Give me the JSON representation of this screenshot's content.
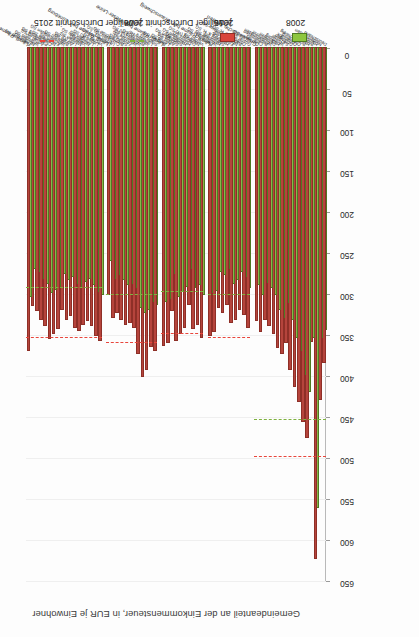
{
  "figure": {
    "axis_title": "Gemeindeanteil an der Einkommensteuer, in EUR je Einwohner",
    "orientation": "rotated-90"
  },
  "legend": {
    "items": [
      {
        "key": "avg2015",
        "label": "jeweiliger Durchschnitt 2015",
        "marker": "dashed-line",
        "color": "#e8463c"
      },
      {
        "key": "avg2008",
        "label": "jeweiliger Durchschnitt 2008",
        "marker": "dashed-line",
        "color": "#7fb23f"
      },
      {
        "key": "y2015",
        "label": "2015",
        "marker": "bar",
        "color": "#d9453c"
      },
      {
        "key": "y2008",
        "label": "2008",
        "marker": "bar",
        "color": "#8ec63f"
      }
    ]
  },
  "chart_data": {
    "type": "bar",
    "orientation": "horizontal",
    "title": "",
    "xlabel": "Gemeindeanteil an der Einkommensteuer, in EUR je Einwohner",
    "ylabel": "",
    "xlim": [
      0,
      650
    ],
    "xticks": [
      0,
      50,
      100,
      150,
      200,
      250,
      300,
      350,
      400,
      450,
      500,
      550,
      600,
      650
    ],
    "grid": true,
    "legend_position": "right",
    "series": [
      {
        "name": "2008",
        "color": "#8ec63f"
      },
      {
        "name": "2015",
        "color": "#d9453c"
      }
    ],
    "groups": [
      {
        "name": "Großstädtische Zentren",
        "avg2008": 452,
        "avg2015": 497,
        "categories": [
          {
            "label": "Deutschland",
            "y2008": 343,
            "y2015": 383
          },
          {
            "label": "Niedersachsen",
            "y2008": 352,
            "y2015": 428
          },
          {
            "label": "Hamburg",
            "y2008": 560,
            "y2015": 622
          },
          {
            "label": "Bremen",
            "y2008": 352,
            "y2015": 357
          },
          {
            "label": "Hannover",
            "y2008": 418,
            "y2015": 475
          },
          {
            "label": "Braunschweig",
            "y2008": 398,
            "y2015": 455
          },
          {
            "label": "Oldenburg",
            "y2008": 368,
            "y2015": 430
          },
          {
            "label": "Osnabrück",
            "y2008": 352,
            "y2015": 412
          },
          {
            "label": "Göttingen",
            "y2008": 330,
            "y2015": 392
          },
          {
            "label": "Salzgitter",
            "y2008": 310,
            "y2015": 358
          },
          {
            "label": "Wolfsburg",
            "y2008": 328,
            "y2015": 372
          },
          {
            "label": "Hildesheim",
            "y2008": 318,
            "y2015": 365
          },
          {
            "label": "Delmenhorst",
            "y2008": 300,
            "y2015": 348
          },
          {
            "label": "Wilhelmshaven",
            "y2008": 292,
            "y2015": 338
          },
          {
            "label": "Bremerhaven",
            "y2008": 285,
            "y2015": 330
          },
          {
            "label": "Celle SG",
            "y2008": 300,
            "y2015": 345
          },
          {
            "label": "Cuxhaven SG",
            "y2008": 288,
            "y2015": 332
          }
        ]
      },
      {
        "name": "Ländl. Räume bez. Braunschweig",
        "avg2008": 300,
        "avg2015": 352,
        "categories": [
          {
            "label": "Goslar SG",
            "y2008": 292,
            "y2015": 340
          },
          {
            "label": "Osterode a. H. SG",
            "y2008": 278,
            "y2015": 325
          },
          {
            "label": "Bad Gandersheim SG",
            "y2008": 272,
            "y2015": 318
          },
          {
            "label": "Northeim SG",
            "y2008": 282,
            "y2015": 330
          },
          {
            "label": "Einbeck SG",
            "y2008": 286,
            "y2015": 334
          },
          {
            "label": "Herzberg a. H. SG",
            "y2008": 268,
            "y2015": 312
          },
          {
            "label": "Seesen SG",
            "y2008": 276,
            "y2015": 322
          },
          {
            "label": "Helmstedt SG",
            "y2008": 272,
            "y2015": 316
          },
          {
            "label": "Wolfenbüttel SG",
            "y2008": 295,
            "y2015": 345
          },
          {
            "label": "Peine SG",
            "y2008": 298,
            "y2015": 350
          }
        ]
      },
      {
        "name": "Ländl. Räume bez. Weser-Leine",
        "avg2008": 296,
        "avg2015": 348,
        "categories": [
          {
            "label": "Verden SG",
            "y2008": 300,
            "y2015": 352
          },
          {
            "label": "Nienburg (W) SG",
            "y2008": 288,
            "y2015": 336
          },
          {
            "label": "Diepholz SG",
            "y2008": 292,
            "y2015": 342
          },
          {
            "label": "Holzminden SG",
            "y2008": 268,
            "y2015": 312
          },
          {
            "label": "Hameln SG",
            "y2008": 290,
            "y2015": 340
          },
          {
            "label": "Stadthagen SG",
            "y2008": 296,
            "y2015": 348
          },
          {
            "label": "Springe SG",
            "y2008": 302,
            "y2015": 356
          },
          {
            "label": "Alfeld SG",
            "y2008": 274,
            "y2015": 320
          },
          {
            "label": "Lehrte SG",
            "y2008": 305,
            "y2015": 358
          },
          {
            "label": "Burgdorf SG",
            "y2008": 308,
            "y2015": 362
          }
        ]
      },
      {
        "name": "Ländl. Räume bez. Lüneburg",
        "avg2008": 300,
        "avg2015": 358,
        "categories": [
          {
            "label": "Stade SG",
            "y2008": 312,
            "y2015": 368
          },
          {
            "label": "Lüneburg HS",
            "y2008": 308,
            "y2015": 364
          },
          {
            "label": "Verden (A) SG",
            "y2008": 318,
            "y2015": 392
          },
          {
            "label": "Rotenburg (A) SG",
            "y2008": 322,
            "y2015": 400
          },
          {
            "label": "Winsen (L) SG",
            "y2008": 316,
            "y2015": 372
          },
          {
            "label": "Walsrode SG",
            "y2008": 292,
            "y2015": 340
          },
          {
            "label": "Zeven SG",
            "y2008": 286,
            "y2015": 334
          },
          {
            "label": "Soltau SG",
            "y2008": 288,
            "y2015": 336
          },
          {
            "label": "Bremervörde SG",
            "y2008": 282,
            "y2015": 330
          },
          {
            "label": "Cuxhaven (W) SG",
            "y2008": 276,
            "y2015": 322
          },
          {
            "label": "Uelzen SG",
            "y2008": 280,
            "y2015": 328
          },
          {
            "label": "Lüchow (W) SG",
            "y2008": 258,
            "y2015": 300
          }
        ]
      },
      {
        "name": "Ländl. Räume bez. Weser-Ems",
        "avg2008": 292,
        "avg2015": 352,
        "categories": [
          {
            "label": "Vechta SG",
            "y2008": 300,
            "y2015": 356
          },
          {
            "label": "Lingen (E) SG",
            "y2008": 296,
            "y2015": 350
          },
          {
            "label": "Löningen SG",
            "y2008": 288,
            "y2015": 338
          },
          {
            "label": "Nordenham SG",
            "y2008": 280,
            "y2015": 332
          },
          {
            "label": "Varel SG",
            "y2008": 284,
            "y2015": 336
          },
          {
            "label": "Meppen SG",
            "y2008": 292,
            "y2015": 344
          },
          {
            "label": "Leer (O) SG",
            "y2008": 286,
            "y2015": 340
          },
          {
            "label": "Aurich SG",
            "y2008": 278,
            "y2015": 326
          },
          {
            "label": "Brake (U) SG",
            "y2008": 282,
            "y2015": 330
          },
          {
            "label": "Wilhelmshaven SG",
            "y2008": 274,
            "y2015": 318
          },
          {
            "label": "Emden SG",
            "y2008": 290,
            "y2015": 342
          },
          {
            "label": "Nordhorn SG",
            "y2008": 294,
            "y2015": 348
          },
          {
            "label": "Cloppenburg SG",
            "y2008": 298,
            "y2015": 354
          },
          {
            "label": "Papenburg SG",
            "y2008": 286,
            "y2015": 338
          },
          {
            "label": "Anhalt SG",
            "y2008": 280,
            "y2015": 330
          },
          {
            "label": "Wittmund SG",
            "y2008": 272,
            "y2015": 320
          },
          {
            "label": "Norden SG",
            "y2008": 268,
            "y2015": 314
          },
          {
            "label": "Friesoythe SG",
            "y2008": 302,
            "y2015": 368
          }
        ]
      }
    ]
  }
}
